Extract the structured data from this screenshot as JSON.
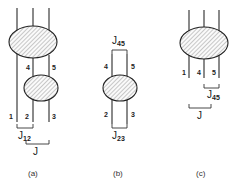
{
  "figure": {
    "panels": [
      {
        "caption": "(a)",
        "line_labels": [
          "1",
          "2",
          "3",
          "4",
          "5"
        ],
        "couplings": [
          {
            "symbol": "J",
            "subscript": "12"
          },
          {
            "symbol": "J",
            "subscript": ""
          }
        ],
        "blobs": 2
      },
      {
        "caption": "(b)",
        "line_labels": [
          "4",
          "5",
          "2",
          "3"
        ],
        "couplings": [
          {
            "symbol": "J",
            "subscript": "45"
          },
          {
            "symbol": "J",
            "subscript": "23"
          }
        ],
        "blobs": 1
      },
      {
        "caption": "(c)",
        "line_labels": [
          "1",
          "4",
          "5"
        ],
        "couplings": [
          {
            "symbol": "J",
            "subscript": "45"
          },
          {
            "symbol": "J",
            "subscript": ""
          }
        ],
        "blobs": 1
      }
    ]
  }
}
